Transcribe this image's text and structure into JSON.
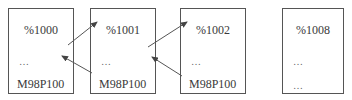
{
  "diagram": {
    "boxes": [
      {
        "id": "program-1000",
        "title": "%1000",
        "line2": "…",
        "line3": "M98P100"
      },
      {
        "id": "program-1001",
        "title": "%1001",
        "line2": "…",
        "line3": "M98P100"
      },
      {
        "id": "program-1002",
        "title": "%1002",
        "line2": "…",
        "line3": "M98P100"
      },
      {
        "id": "program-1008",
        "title": "%1008",
        "line2": "…",
        "line3": "…"
      }
    ],
    "arrows": [
      {
        "from": "%1000",
        "to": "%1001",
        "meaning": "call"
      },
      {
        "from": "%1001",
        "to": "%1000",
        "meaning": "return"
      },
      {
        "from": "%1001",
        "to": "%1002",
        "meaning": "call"
      },
      {
        "from": "%1002",
        "to": "%1001",
        "meaning": "return"
      }
    ],
    "colors": {
      "stroke": "#555555",
      "text": "#3a3a3a"
    }
  }
}
